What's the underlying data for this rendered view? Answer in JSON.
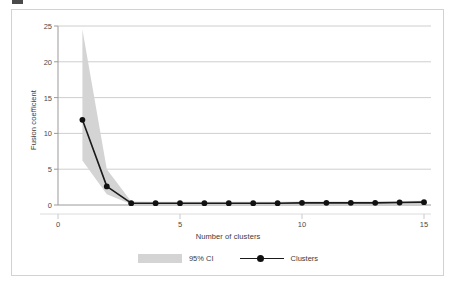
{
  "figure": {
    "ylabel": "Fusion coefficient",
    "xlabel": "Number of clusters"
  },
  "colors": {
    "band": "#d4d4d4",
    "line": "#1a1a1a",
    "marker": "#111111",
    "grid": "#c8c8c8",
    "axis": "#9a9a9a",
    "frame": "#d2d2d2",
    "text": "#3b3b3b"
  },
  "legend": {
    "items": [
      {
        "label": "95% CI",
        "type": "band"
      },
      {
        "label": "Clusters",
        "type": "line-marker"
      }
    ]
  },
  "axes": {
    "y_ticks": [
      "25",
      "20",
      "15",
      "10",
      "5",
      "0"
    ],
    "x_ticks": [
      "0",
      "5",
      "10",
      "15"
    ]
  },
  "chart_data": {
    "type": "line",
    "title": "",
    "xlabel": "Number of clusters",
    "ylabel": "Fusion coefficient",
    "xlim": [
      0,
      15
    ],
    "ylim": [
      0,
      25
    ],
    "xticks": [
      0,
      5,
      10,
      15
    ],
    "yticks": [
      0,
      5,
      10,
      15,
      20,
      25
    ],
    "grid": "horizontal",
    "legend_position": "bottom-center",
    "x": [
      1,
      2,
      3,
      4,
      5,
      6,
      7,
      8,
      9,
      10,
      11,
      12,
      13,
      14,
      15
    ],
    "series": [
      {
        "name": "Clusters",
        "values": [
          11.9,
          2.6,
          0.25,
          0.25,
          0.25,
          0.25,
          0.25,
          0.25,
          0.25,
          0.3,
          0.3,
          0.3,
          0.3,
          0.35,
          0.4
        ]
      }
    ],
    "bands": [
      {
        "name": "95% CI",
        "lower": [
          6.2,
          1.5,
          0.1,
          0.1,
          0.1,
          0.1,
          0.1,
          0.1,
          0.1,
          0.1,
          0.1,
          0.1,
          0.1,
          0.1,
          0.1
        ],
        "upper": [
          24.5,
          5.0,
          0.5,
          0.45,
          0.45,
          0.45,
          0.45,
          0.45,
          0.45,
          0.5,
          0.5,
          0.5,
          0.5,
          0.55,
          0.6
        ]
      }
    ]
  }
}
